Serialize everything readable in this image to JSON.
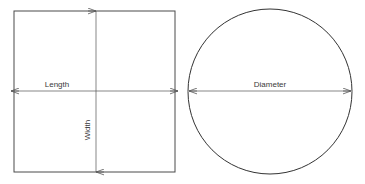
{
  "figure": {
    "background_color": "#ffffff",
    "stroke_color": "#4a4a4a",
    "arrow_color": "#555555",
    "text_color": "#3a3a3a",
    "width": 365,
    "height": 184
  },
  "shapes": {
    "rectangle": {
      "name": "rectangle",
      "x": 14,
      "y": 11,
      "width": 161,
      "height": 161,
      "dimensions": {
        "length": {
          "label": "Length",
          "orientation": "horizontal",
          "label_x": 57,
          "label_y": 87,
          "arrow_y": 91,
          "arrow_x1": 11,
          "arrow_x2": 178
        },
        "width": {
          "label": "Width",
          "orientation": "vertical",
          "label_x": 90,
          "label_y": 130,
          "arrow_x": 96,
          "arrow_y1": 11,
          "arrow_y2": 172
        }
      }
    },
    "circle": {
      "name": "circle",
      "cx": 270,
      "cy": 91.5,
      "rx": 82,
      "ry": 82.5,
      "dimensions": {
        "diameter": {
          "label": "Diameter",
          "orientation": "horizontal",
          "label_x": 270,
          "label_y": 87,
          "arrow_y": 91,
          "arrow_x1": 189,
          "arrow_x2": 351
        }
      }
    }
  }
}
